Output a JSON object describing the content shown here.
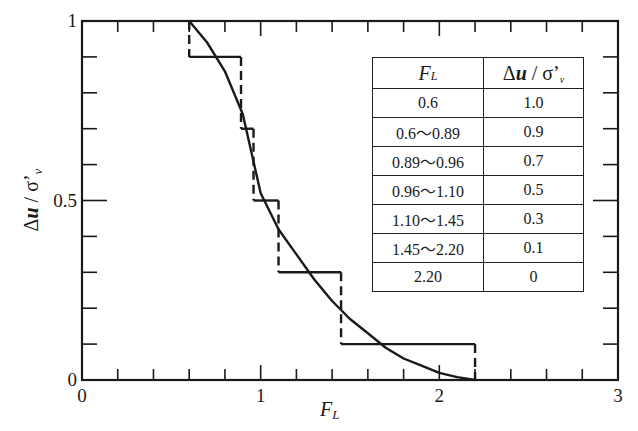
{
  "chart_data": {
    "type": "line",
    "title": "",
    "xlabel": "F_L",
    "ylabel": "Δu / σ'_v",
    "xlim": [
      0,
      3
    ],
    "ylim": [
      0,
      1
    ],
    "x_ticks": [
      0,
      1,
      2,
      3
    ],
    "x_tick_labels": [
      "0",
      "1",
      "2",
      "3"
    ],
    "x_minor_step": 0.2,
    "y_ticks": [
      0,
      0.5,
      1
    ],
    "y_tick_labels": [
      "0",
      "0.5",
      "1"
    ],
    "y_minor_step": 0.1,
    "grid": false,
    "series": [
      {
        "name": "step (table values)",
        "style": "step, dashed verticals",
        "steps": [
          {
            "x0": 0.6,
            "x1": 0.89,
            "y": 0.9
          },
          {
            "x0": 0.89,
            "x1": 0.96,
            "y": 0.7
          },
          {
            "x0": 0.96,
            "x1": 1.1,
            "y": 0.5
          },
          {
            "x0": 1.1,
            "x1": 1.45,
            "y": 0.3
          },
          {
            "x0": 1.45,
            "x1": 2.2,
            "y": 0.1
          }
        ],
        "start": {
          "x": 0.6,
          "y": 1.0
        },
        "end": {
          "x": 2.2,
          "y": 0.0
        }
      },
      {
        "name": "fitted curve",
        "style": "solid",
        "x": [
          0.6,
          0.7,
          0.8,
          0.9,
          1.0,
          1.1,
          1.2,
          1.3,
          1.4,
          1.5,
          1.6,
          1.7,
          1.8,
          1.9,
          2.0,
          2.1,
          2.2
        ],
        "y": [
          1.0,
          0.94,
          0.86,
          0.74,
          0.52,
          0.42,
          0.35,
          0.28,
          0.22,
          0.17,
          0.13,
          0.09,
          0.06,
          0.04,
          0.02,
          0.008,
          0.0
        ]
      }
    ],
    "legend_table": {
      "position": "top-right",
      "headers": [
        "F_L",
        "Δu / σ'_v"
      ],
      "rows": [
        [
          "0.6",
          "1.0"
        ],
        [
          "0.6～0.89",
          "0.9"
        ],
        [
          "0.89～0.96",
          "0.7"
        ],
        [
          "0.96～1.10",
          "0.5"
        ],
        [
          "1.10～1.45",
          "0.3"
        ],
        [
          "1.45～2.20",
          "0.1"
        ],
        [
          "2.20",
          "0"
        ]
      ]
    }
  },
  "labels": {
    "x_main": "F",
    "x_sub": "L",
    "y_delta": "Δ",
    "y_u": "u",
    "y_slash": " / ",
    "y_sigma": "σ’",
    "y_sub": "v"
  }
}
